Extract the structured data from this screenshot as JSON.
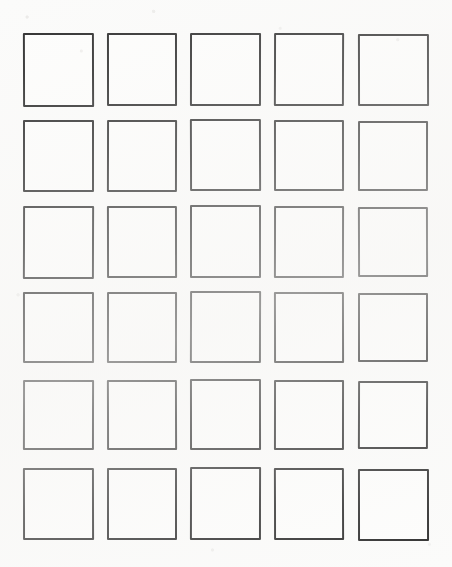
{
  "page": {
    "background_color": "#fbfbfa",
    "width": 452,
    "height": 567
  },
  "grid": {
    "name": "square-grid",
    "columns": 5,
    "rows": 6,
    "cell_count": 30,
    "stroke_color": "#2c2c2c",
    "stroke_width": 2,
    "fill_color": "#fdfdfc",
    "column_lefts": [
      23,
      107,
      190,
      274,
      358
    ],
    "row_tops": [
      33,
      120,
      206,
      292,
      380,
      468
    ],
    "cell_widths": [
      71,
      70,
      70,
      70,
      70
    ],
    "cell_heights": [
      74,
      72,
      73,
      71,
      70,
      72
    ],
    "cells": [
      {
        "row": 1,
        "col": 1,
        "label": "",
        "x": 23,
        "y": 33,
        "w": 71,
        "h": 74
      },
      {
        "row": 1,
        "col": 2,
        "label": "",
        "x": 107,
        "y": 33,
        "w": 70,
        "h": 73
      },
      {
        "row": 1,
        "col": 3,
        "label": "",
        "x": 190,
        "y": 33,
        "w": 71,
        "h": 73
      },
      {
        "row": 1,
        "col": 4,
        "label": "",
        "x": 274,
        "y": 33,
        "w": 70,
        "h": 73
      },
      {
        "row": 1,
        "col": 5,
        "label": "",
        "x": 358,
        "y": 34,
        "w": 71,
        "h": 72
      },
      {
        "row": 2,
        "col": 1,
        "label": "",
        "x": 23,
        "y": 120,
        "w": 71,
        "h": 72
      },
      {
        "row": 2,
        "col": 2,
        "label": "",
        "x": 107,
        "y": 120,
        "w": 70,
        "h": 72
      },
      {
        "row": 2,
        "col": 3,
        "label": "",
        "x": 190,
        "y": 119,
        "w": 71,
        "h": 72
      },
      {
        "row": 2,
        "col": 4,
        "label": "",
        "x": 274,
        "y": 120,
        "w": 70,
        "h": 71
      },
      {
        "row": 2,
        "col": 5,
        "label": "",
        "x": 358,
        "y": 121,
        "w": 70,
        "h": 70
      },
      {
        "row": 3,
        "col": 1,
        "label": "",
        "x": 23,
        "y": 206,
        "w": 71,
        "h": 73
      },
      {
        "row": 3,
        "col": 2,
        "label": "",
        "x": 107,
        "y": 206,
        "w": 70,
        "h": 72
      },
      {
        "row": 3,
        "col": 3,
        "label": "",
        "x": 190,
        "y": 205,
        "w": 71,
        "h": 73
      },
      {
        "row": 3,
        "col": 4,
        "label": "",
        "x": 274,
        "y": 206,
        "w": 70,
        "h": 72
      },
      {
        "row": 3,
        "col": 5,
        "label": "",
        "x": 358,
        "y": 207,
        "w": 70,
        "h": 70
      },
      {
        "row": 4,
        "col": 1,
        "label": "",
        "x": 23,
        "y": 292,
        "w": 71,
        "h": 71
      },
      {
        "row": 4,
        "col": 2,
        "label": "",
        "x": 107,
        "y": 292,
        "w": 70,
        "h": 71
      },
      {
        "row": 4,
        "col": 3,
        "label": "",
        "x": 190,
        "y": 291,
        "w": 71,
        "h": 72
      },
      {
        "row": 4,
        "col": 4,
        "label": "",
        "x": 274,
        "y": 292,
        "w": 70,
        "h": 71
      },
      {
        "row": 4,
        "col": 5,
        "label": "",
        "x": 358,
        "y": 293,
        "w": 70,
        "h": 69
      },
      {
        "row": 5,
        "col": 1,
        "label": "",
        "x": 23,
        "y": 380,
        "w": 71,
        "h": 70
      },
      {
        "row": 5,
        "col": 2,
        "label": "",
        "x": 107,
        "y": 380,
        "w": 70,
        "h": 70
      },
      {
        "row": 5,
        "col": 3,
        "label": "",
        "x": 190,
        "y": 379,
        "w": 71,
        "h": 71
      },
      {
        "row": 5,
        "col": 4,
        "label": "",
        "x": 274,
        "y": 380,
        "w": 70,
        "h": 70
      },
      {
        "row": 5,
        "col": 5,
        "label": "",
        "x": 358,
        "y": 381,
        "w": 70,
        "h": 68
      },
      {
        "row": 6,
        "col": 1,
        "label": "",
        "x": 23,
        "y": 468,
        "w": 71,
        "h": 72
      },
      {
        "row": 6,
        "col": 2,
        "label": "",
        "x": 107,
        "y": 468,
        "w": 70,
        "h": 72
      },
      {
        "row": 6,
        "col": 3,
        "label": "",
        "x": 190,
        "y": 467,
        "w": 71,
        "h": 73
      },
      {
        "row": 6,
        "col": 4,
        "label": "",
        "x": 274,
        "y": 468,
        "w": 70,
        "h": 72
      },
      {
        "row": 6,
        "col": 5,
        "label": "",
        "x": 358,
        "y": 469,
        "w": 71,
        "h": 72
      }
    ]
  }
}
